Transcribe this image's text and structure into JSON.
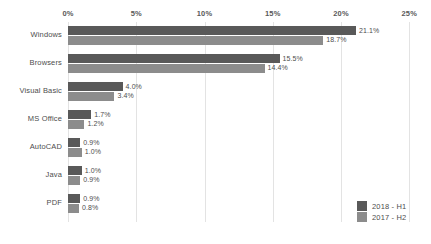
{
  "chart_data": {
    "type": "bar",
    "orientation": "horizontal",
    "title": "",
    "subtitle": "",
    "xlabel": "",
    "ylabel": "",
    "xlim": [
      0,
      25
    ],
    "grid": true,
    "legend_position": "bottom-right",
    "categories": [
      "Windows",
      "Browsers",
      "Visual Basic",
      "MS Office",
      "AutoCAD",
      "Java",
      "PDF"
    ],
    "x_ticks": [
      0,
      5,
      10,
      15,
      20,
      25
    ],
    "x_tick_labels": [
      "0%",
      "5%",
      "10%",
      "15%",
      "20%",
      "25%"
    ],
    "series": [
      {
        "name": "2018 - H1",
        "color": "#595959",
        "values": [
          21.1,
          15.5,
          4.0,
          1.7,
          0.9,
          1.0,
          0.9
        ],
        "value_labels": [
          "21.1%",
          "15.5%",
          "4.0%",
          "1.7%",
          "0.9%",
          "1.0%",
          "0.9%"
        ]
      },
      {
        "name": "2017 - H2",
        "color": "#8c8c8c",
        "values": [
          18.7,
          14.4,
          3.4,
          1.2,
          1.0,
          0.9,
          0.8
        ],
        "value_labels": [
          "18.7%",
          "14.4%",
          "3.4%",
          "1.2%",
          "1.0%",
          "0.9%",
          "0.8%"
        ]
      }
    ]
  },
  "colors": {
    "background": "#ffffff",
    "gridline": "#e3e3e3",
    "text": "#4d4d4d",
    "series_2018_h1": "#595959",
    "series_2017_h2": "#8c8c8c"
  },
  "legend": {
    "items": [
      {
        "label": "2018 - H1",
        "color": "#595959"
      },
      {
        "label": "2017 - H2",
        "color": "#8c8c8c"
      }
    ]
  }
}
